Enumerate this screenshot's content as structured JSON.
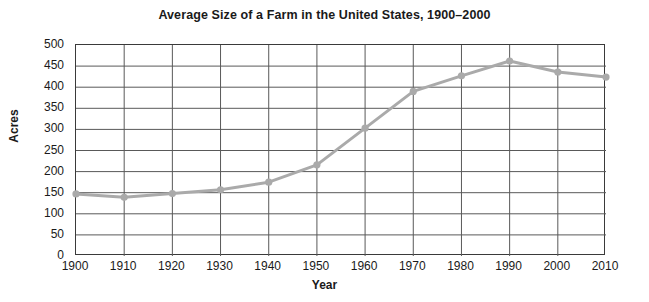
{
  "chart_data": {
    "type": "line",
    "title": "Average Size of a Farm in the United States, 1900–2000",
    "xlabel": "Year",
    "ylabel": "Acres",
    "x": [
      1900,
      1910,
      1920,
      1930,
      1940,
      1950,
      1960,
      1970,
      1980,
      1990,
      2000,
      2010
    ],
    "values": [
      147,
      139,
      148,
      157,
      175,
      216,
      303,
      390,
      427,
      462,
      436,
      424
    ],
    "xticklabels": [
      "1900",
      "1910",
      "1920",
      "1930",
      "1940",
      "1950",
      "1960",
      "1970",
      "1980",
      "1990",
      "2000",
      "2010"
    ],
    "yticks": [
      0,
      50,
      100,
      150,
      200,
      250,
      300,
      350,
      400,
      450,
      500
    ],
    "yticklabels": [
      "0",
      "50",
      "100",
      "150",
      "200",
      "250",
      "300",
      "350",
      "400",
      "450",
      "500"
    ],
    "xlim": [
      1900,
      2010
    ],
    "ylim": [
      0,
      500
    ],
    "grid": true,
    "legend": false,
    "series_color": "#aaaaaa",
    "grid_color": "#595959",
    "marker": "circle"
  }
}
